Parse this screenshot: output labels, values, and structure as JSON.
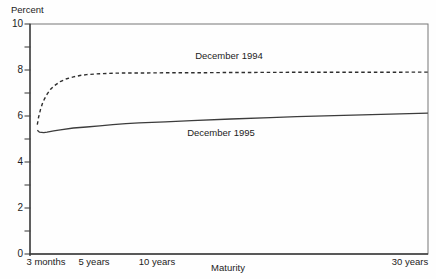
{
  "chart_data": {
    "type": "line",
    "title": "",
    "ylabel": "Percent",
    "xlabel": "Maturity",
    "ylim": [
      0,
      10
    ],
    "y_major_tick_labels": [
      "10",
      "8",
      "6",
      "4",
      "2",
      "0"
    ],
    "y_minor_tick_step": 1,
    "grid": "off",
    "legend_position": "inline-annotations-on-lines",
    "x_tick_labels": [
      "3 months",
      "5 years",
      "10 years",
      "30 years"
    ],
    "x_tick_years": [
      0.25,
      5,
      10,
      30
    ],
    "x_axis_unit": "maturity in years, linear scale",
    "axis_color": "#555555",
    "background_color": "#fefefe",
    "series": [
      {
        "name": "December 1994",
        "line_style": "dashed",
        "color": "#2e2e2e",
        "x_years": [
          0.25,
          0.35,
          0.5,
          0.65,
          0.8,
          1,
          1.25,
          1.5,
          2,
          2.5,
          3,
          3.5,
          4,
          5,
          6,
          7,
          8,
          10,
          12,
          15,
          20,
          25,
          30
        ],
        "values": [
          5.62,
          5.95,
          6.3,
          6.55,
          6.75,
          6.95,
          7.15,
          7.3,
          7.5,
          7.62,
          7.7,
          7.76,
          7.8,
          7.84,
          7.86,
          7.87,
          7.87,
          7.88,
          7.88,
          7.89,
          7.9,
          7.9,
          7.91
        ]
      },
      {
        "name": "December 1995",
        "line_style": "solid",
        "color": "#3c3c3c",
        "x_years": [
          0.25,
          0.4,
          0.75,
          1,
          1.5,
          2,
          3,
          4,
          5,
          6,
          7,
          8,
          10,
          12,
          15,
          18,
          20,
          25,
          30
        ],
        "values": [
          5.38,
          5.3,
          5.28,
          5.3,
          5.35,
          5.4,
          5.48,
          5.52,
          5.57,
          5.62,
          5.67,
          5.7,
          5.75,
          5.8,
          5.87,
          5.93,
          5.97,
          6.05,
          6.12
        ]
      }
    ]
  }
}
